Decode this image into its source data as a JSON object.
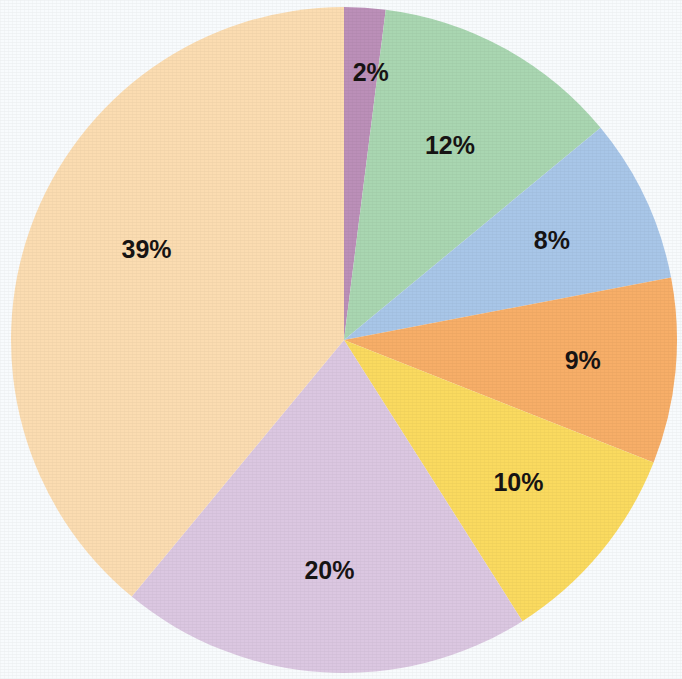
{
  "chart_data": {
    "type": "pie",
    "title": "",
    "subtitle": "",
    "xlabel": "",
    "ylabel": "",
    "legend_position": "none",
    "grid": false,
    "units": "percent",
    "total": 100,
    "start_angle_deg": 0,
    "direction": "clockwise",
    "categories": [
      "2%",
      "12%",
      "8%",
      "9%",
      "10%",
      "20%",
      "39%"
    ],
    "values": [
      2,
      12,
      8,
      9,
      10,
      20,
      39
    ],
    "labels": [
      "2%",
      "12%",
      "8%",
      "9%",
      "10%",
      "20%",
      "39%"
    ],
    "colors": [
      "#bb8fb8",
      "#a9d6b1",
      "#a8c6e8",
      "#f7ae68",
      "#fada5f",
      "#dbc7e1",
      "#fbdcb1"
    ],
    "slices": [
      {
        "label": "2%",
        "value": 2,
        "color": "#bb8fb8",
        "start_deg": 0,
        "end_deg": 7.2
      },
      {
        "label": "12%",
        "value": 12,
        "color": "#a9d6b1",
        "start_deg": 7.2,
        "end_deg": 50.4
      },
      {
        "label": "8%",
        "value": 8,
        "color": "#a8c6e8",
        "start_deg": 50.4,
        "end_deg": 79.2
      },
      {
        "label": "9%",
        "value": 9,
        "color": "#f7ae68",
        "start_deg": 79.2,
        "end_deg": 111.6
      },
      {
        "label": "10%",
        "value": 10,
        "color": "#fada5f",
        "start_deg": 111.6,
        "end_deg": 147.6
      },
      {
        "label": "20%",
        "value": 20,
        "color": "#dbc7e1",
        "start_deg": 147.6,
        "end_deg": 219.6
      },
      {
        "label": "39%",
        "value": 39,
        "color": "#fbdcb1",
        "start_deg": 219.6,
        "end_deg": 360
      }
    ]
  },
  "geometry": {
    "center_x": 344,
    "center_y": 340,
    "radius": 333,
    "label_radius_ratio": 0.66,
    "label_font_size": 25
  },
  "style": {
    "background": "#f8fbfd",
    "label_color": "#171414",
    "stroke": "none"
  }
}
